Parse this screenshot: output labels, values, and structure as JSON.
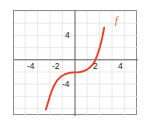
{
  "figure": {
    "background_color": "#ffffff",
    "frame_color": "#8d8d8d",
    "grid_color": "#e2e2e2",
    "axis_color": "#555555",
    "curve_color": "#e8412c",
    "label_color": "#1b1b1b"
  },
  "chart_data": {
    "type": "line",
    "title": "",
    "xlabel": "",
    "ylabel": "",
    "xlim": [
      -5,
      5
    ],
    "ylim": [
      -8,
      8
    ],
    "grid": true,
    "grid_step": 1,
    "legend": "none",
    "x_ticks": [
      -4,
      -2,
      2,
      4
    ],
    "x_tick_labels": [
      "-4",
      "-2",
      "2",
      "4"
    ],
    "y_ticks": [
      4,
      -4
    ],
    "y_tick_labels": [
      "4",
      "-4"
    ],
    "annotations": [
      {
        "text": "f",
        "x": 2.6,
        "y": 7.0,
        "color": "#e8412c"
      }
    ],
    "series": [
      {
        "name": "f",
        "color": "#e8412c",
        "function": "cubic with inflection near (0, -2)",
        "x": [
          -2.35,
          -2.2,
          -2.0,
          -1.8,
          -1.6,
          -1.4,
          -1.2,
          -1.0,
          -0.8,
          -0.6,
          -0.4,
          -0.2,
          0.0,
          0.2,
          0.4,
          0.6,
          0.8,
          1.0,
          1.2,
          1.4,
          1.6,
          1.8,
          2.0,
          2.2,
          2.35
        ],
        "y": [
          -8.0,
          -7.0,
          -5.7,
          -4.6,
          -3.8,
          -3.2,
          -2.8,
          -2.5,
          -2.3,
          -2.15,
          -2.06,
          -2.01,
          -2.0,
          -1.99,
          -1.94,
          -1.85,
          -1.7,
          -1.5,
          -1.2,
          -0.8,
          -0.2,
          0.8,
          2.0,
          3.6,
          5.2
        ]
      }
    ]
  },
  "curve_geometry": {
    "path": "M 61.0 105.0 C 64.0 96.0 66.5 86.0 69.0 78.0 C 71.5 70.0 74.0 65.0 78.0 63.0 C 82.0 61.2 86.5 60.7 91.0 59.6 C 95.5 58.5 99.0 55.0 102.5 47.0 C 106.0 39.0 109.0 26.0 112.5 10.0"
  },
  "axes_pixels": {
    "x_axis_y": 49,
    "y_axis_x": 61,
    "unit_px": 12.4
  },
  "tick_positions": {
    "x": [
      {
        "label": "-4",
        "left": 13,
        "top": 62
      },
      {
        "label": "-2",
        "left": 38,
        "top": 62
      },
      {
        "label": "2",
        "left": 90,
        "top": 62
      },
      {
        "label": "4",
        "left": 115,
        "top": 62
      }
    ],
    "y": [
      {
        "label": "4",
        "left": 64,
        "top": 20
      },
      {
        "label": "-4",
        "left": 61,
        "top": 82
      }
    ]
  }
}
